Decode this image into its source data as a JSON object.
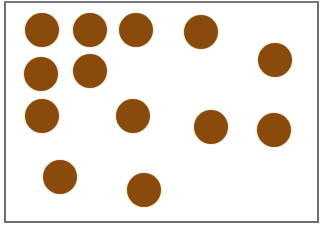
{
  "figure": {
    "background": "#ffffff",
    "border_color": "#6f6f6f",
    "dot_color": "#8a4a0b",
    "dot_count": 13,
    "dots": [
      {
        "cx": 42,
        "cy": 30,
        "r": 17
      },
      {
        "cx": 90,
        "cy": 30,
        "r": 17
      },
      {
        "cx": 136,
        "cy": 30,
        "r": 17
      },
      {
        "cx": 201,
        "cy": 32,
        "r": 17
      },
      {
        "cx": 275,
        "cy": 60,
        "r": 17
      },
      {
        "cx": 41,
        "cy": 74,
        "r": 17
      },
      {
        "cx": 90,
        "cy": 71,
        "r": 17
      },
      {
        "cx": 42,
        "cy": 116,
        "r": 17
      },
      {
        "cx": 133,
        "cy": 116,
        "r": 17
      },
      {
        "cx": 211,
        "cy": 127,
        "r": 17
      },
      {
        "cx": 274,
        "cy": 130,
        "r": 17
      },
      {
        "cx": 60,
        "cy": 177,
        "r": 17
      },
      {
        "cx": 144,
        "cy": 190,
        "r": 17
      }
    ]
  }
}
